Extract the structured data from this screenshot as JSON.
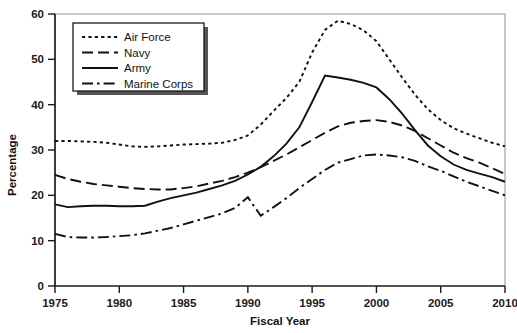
{
  "chart_data": {
    "type": "line",
    "title": "",
    "xlabel": "Fiscal Year",
    "ylabel": "Percentage",
    "xlim": [
      1975,
      2010
    ],
    "ylim": [
      0,
      60
    ],
    "xticks": [
      1975,
      1980,
      1985,
      1990,
      1995,
      2000,
      2005,
      2010
    ],
    "yticks": [
      0,
      10,
      20,
      30,
      40,
      50,
      60
    ],
    "grid": false,
    "legend_position": "upper-left-inside",
    "x": [
      1975,
      1976,
      1977,
      1978,
      1979,
      1980,
      1981,
      1982,
      1983,
      1984,
      1985,
      1986,
      1987,
      1988,
      1989,
      1990,
      1991,
      1992,
      1993,
      1994,
      1995,
      1996,
      1997,
      1998,
      1999,
      2000,
      2001,
      2002,
      2003,
      2004,
      2005,
      2006,
      2007,
      2008,
      2009,
      2010
    ],
    "series": [
      {
        "name": "Air Force",
        "dash": "dotted",
        "values": [
          32.0,
          32.0,
          31.9,
          31.8,
          31.6,
          31.2,
          30.8,
          30.7,
          30.8,
          31.0,
          31.2,
          31.3,
          31.4,
          31.6,
          32.2,
          33.2,
          35.6,
          38.6,
          41.5,
          45.0,
          51.5,
          56.5,
          58.5,
          57.8,
          56.4,
          54.0,
          50.0,
          46.0,
          42.2,
          39.0,
          36.6,
          34.8,
          33.6,
          32.6,
          31.6,
          30.8
        ]
      },
      {
        "name": "Navy",
        "dash": "dashed",
        "values": [
          24.5,
          23.6,
          23.0,
          22.5,
          22.2,
          21.9,
          21.6,
          21.4,
          21.3,
          21.3,
          21.6,
          22.0,
          22.6,
          23.2,
          24.0,
          25.0,
          26.2,
          27.6,
          29.0,
          30.6,
          32.2,
          33.8,
          35.2,
          36.0,
          36.4,
          36.6,
          36.2,
          35.4,
          34.2,
          32.6,
          31.0,
          29.4,
          28.2,
          27.2,
          26.0,
          24.7
        ]
      },
      {
        "name": "Army",
        "dash": "solid",
        "values": [
          18.0,
          17.4,
          17.6,
          17.7,
          17.7,
          17.6,
          17.6,
          17.7,
          18.6,
          19.4,
          20.0,
          20.6,
          21.4,
          22.2,
          23.2,
          24.6,
          26.3,
          28.6,
          31.4,
          35.0,
          40.6,
          46.4,
          46.0,
          45.5,
          44.8,
          43.8,
          41.2,
          38.0,
          34.4,
          31.0,
          28.6,
          26.8,
          25.6,
          24.8,
          24.0,
          23.0
        ]
      },
      {
        "name": "Marine Corps",
        "dash": "dashdot",
        "values": [
          11.5,
          10.8,
          10.7,
          10.7,
          10.8,
          11.0,
          11.2,
          11.6,
          12.2,
          12.8,
          13.6,
          14.4,
          15.2,
          16.0,
          17.2,
          19.6,
          15.5,
          17.4,
          19.4,
          21.6,
          23.6,
          25.6,
          27.2,
          28.0,
          28.8,
          29.0,
          28.8,
          28.4,
          27.6,
          26.4,
          25.4,
          24.2,
          23.0,
          22.0,
          21.0,
          20.0
        ]
      }
    ]
  },
  "legend": {
    "items": [
      {
        "label": "Air Force"
      },
      {
        "label": "Navy"
      },
      {
        "label": "Army"
      },
      {
        "label": "Marine Corps"
      }
    ]
  }
}
